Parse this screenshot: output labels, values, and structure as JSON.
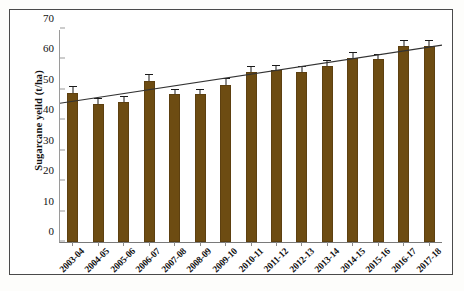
{
  "chart_data": {
    "type": "bar",
    "title": "",
    "subtitle": "",
    "xlabel": "",
    "ylabel": "Sugarcane yeild (t/ha)",
    "ylim": [
      0,
      70
    ],
    "yticks": [
      0,
      10,
      20,
      30,
      40,
      50,
      60,
      70
    ],
    "ytick_labels": [
      "0",
      "10",
      "20",
      "30",
      "40",
      "50",
      "60",
      "70"
    ],
    "grid": false,
    "legend": "none",
    "categories": [
      "2003-04",
      "2004-05",
      "2005-06",
      "2006-07",
      "2007-08",
      "2008-09",
      "2009-10",
      "2010-11",
      "2011-12",
      "2012-13",
      "2013-14",
      "2014-15",
      "2015-16",
      "2016-17",
      "2017-18"
    ],
    "series": [
      {
        "name": "Sugarcane yeild (t/ha)",
        "values": [
          49.0,
          45.5,
          46.0,
          53.0,
          48.5,
          48.5,
          51.5,
          56.0,
          56.5,
          56.0,
          58.0,
          60.5,
          60.0,
          64.5,
          64.5
        ],
        "errors": [
          2.0,
          1.5,
          1.5,
          2.0,
          1.5,
          1.5,
          2.0,
          1.5,
          1.5,
          1.5,
          1.5,
          1.5,
          1.5,
          1.5,
          1.5
        ],
        "color": "#6d4c12"
      }
    ],
    "trendline": {
      "name": "linear trend",
      "start_value": 45.8,
      "end_value": 65.0,
      "color": "#333333"
    }
  },
  "colors": {
    "bar": "#6d4c12",
    "bar_edge": "#5d4010",
    "axis": "#7a7a7a",
    "error_bar": "#1a1a1a",
    "trend": "#333333",
    "frame": "#4a4a4a",
    "background": "#ffffff"
  }
}
